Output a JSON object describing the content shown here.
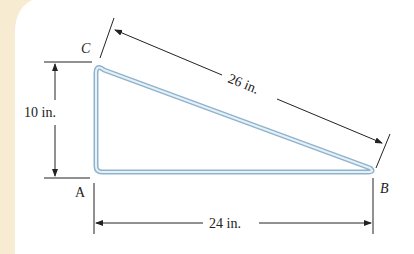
{
  "figure": {
    "points": {
      "A": {
        "label": "A",
        "x": 96,
        "y": 172
      },
      "B": {
        "label": "B",
        "x": 373,
        "y": 172
      },
      "C": {
        "label": "C",
        "x": 96,
        "y": 67
      }
    },
    "dimensions": {
      "height": "10 in.",
      "hypotenuse": "26 in.",
      "base": "24 in."
    },
    "colors": {
      "background_band": "#f7ecd2",
      "rod_outer": "#8fb3cc",
      "rod_inner": "#e6f0f7",
      "line": "#222222"
    }
  }
}
